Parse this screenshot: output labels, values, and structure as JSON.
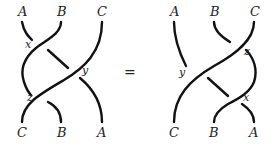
{
  "left": {
    "top_labels": [
      "A",
      "B",
      "C"
    ],
    "bottom_labels": [
      "C",
      "B",
      "A"
    ],
    "crossing_labels": {
      "x": "x",
      "y": "y",
      "z": "z"
    }
  },
  "right": {
    "top_labels": [
      "A",
      "B",
      "C"
    ],
    "bottom_labels": [
      "C",
      "B",
      "A"
    ],
    "crossing_labels": {
      "x": "x",
      "y": "y",
      "z": "z"
    }
  },
  "equals_sign": "=",
  "colors": {
    "stroke": "#111111",
    "text": "#222222",
    "background": "#ffffff"
  }
}
